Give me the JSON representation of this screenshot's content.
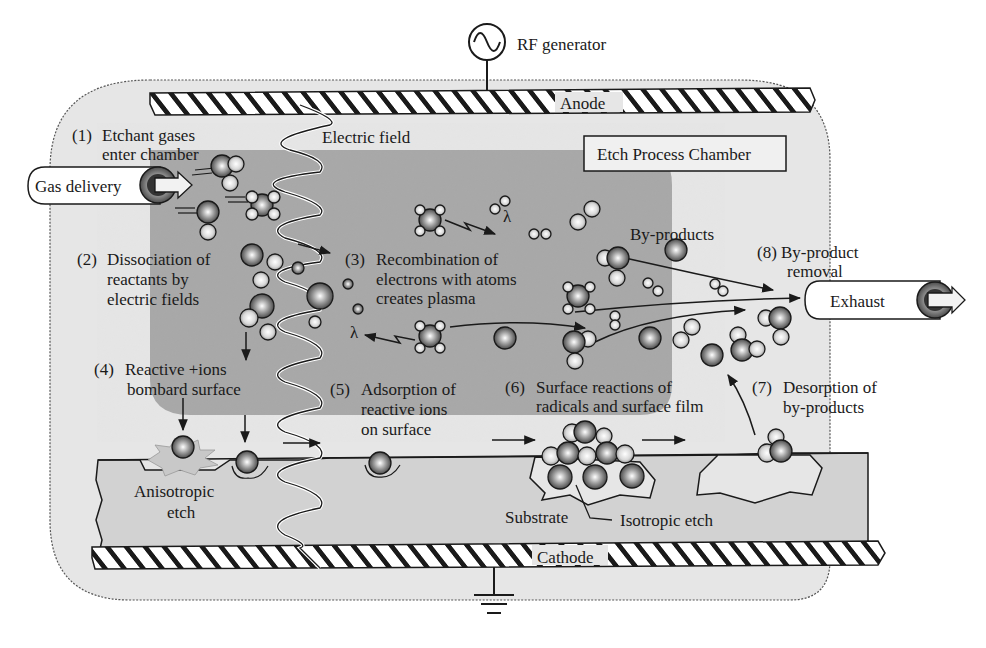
{
  "labels": {
    "rf_generator": "RF generator",
    "anode": "Anode",
    "cathode": "Cathode",
    "electric_field": "Electric field",
    "chamber_box": "Etch Process Chamber",
    "gas_delivery": "Gas delivery",
    "exhaust": "Exhaust",
    "by_products": "By-products",
    "substrate": "Substrate",
    "anisotropic_line1": "Anisotropic",
    "anisotropic_line2": "etch",
    "isotropic": "Isotropic etch",
    "lambda": "λ"
  },
  "steps": [
    {
      "num": "(1)",
      "line1": "Etchant gases",
      "line2": "enter chamber"
    },
    {
      "num": "(2)",
      "line1": "Dissociation of",
      "line2": "reactants by",
      "line3": "electric fields"
    },
    {
      "num": "(3)",
      "line1": "Recombination of",
      "line2": "electrons with atoms",
      "line3": "creates plasma"
    },
    {
      "num": "(4)",
      "line1": "Reactive +ions",
      "line2": "bombard surface"
    },
    {
      "num": "(5)",
      "line1": "Adsorption of",
      "line2": "reactive ions",
      "line3": "on surface"
    },
    {
      "num": "(6)",
      "line1": "Surface reactions of",
      "line2": "radicals and surface film"
    },
    {
      "num": "(7)",
      "line1": "Desorption of",
      "line2": "by-products"
    },
    {
      "num": "(8)",
      "line1": "By-product",
      "line2": "removal"
    }
  ],
  "colors": {
    "outer_chamber": "#e6e6e6",
    "plasma_region": "#a9a9a9",
    "substrate": "#d4d4d4",
    "ink": "#1a1a1a"
  }
}
